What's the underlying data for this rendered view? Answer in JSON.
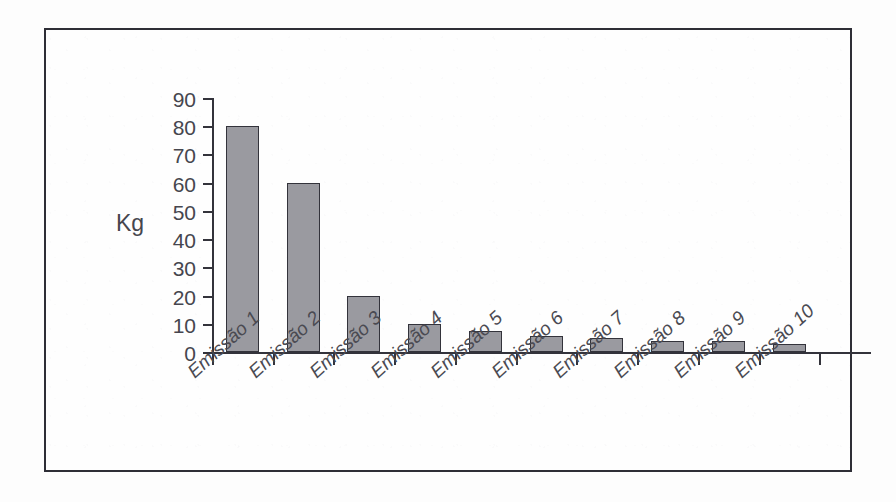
{
  "chart_data": {
    "type": "bar",
    "title": "",
    "subtitle": "",
    "xlabel": "",
    "ylabel": "Kg",
    "ylim": [
      0,
      90
    ],
    "ytick_labels": [
      "90",
      "80",
      "70",
      "60",
      "50",
      "40",
      "30",
      "20",
      "10",
      "0"
    ],
    "yticks": [
      90,
      80,
      70,
      60,
      50,
      40,
      30,
      20,
      10,
      0
    ],
    "grid": false,
    "legend": false,
    "legend_position": "none",
    "categories": [
      "Emissão 1",
      "Emissão 2",
      "Emissão 3",
      "Emissão 4",
      "Emissão 5",
      "Emissão 6",
      "Emissão 7",
      "Emissão 8",
      "Emissão 9",
      "Emissão 10"
    ],
    "values": [
      80,
      60,
      20,
      10,
      7.5,
      5.5,
      5,
      4,
      4,
      3
    ],
    "bar_color": "#9a9aa0",
    "bar_border_color": "#33333b",
    "axis_color": "#33333b",
    "text_color": "#46464e",
    "background_color": "#fefefe"
  }
}
